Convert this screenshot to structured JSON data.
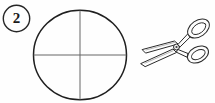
{
  "worksheet": {
    "background_color": "#fefefe",
    "ink_color": "#1a1a1a",
    "line_color": "#555555",
    "width": 215,
    "height": 103
  },
  "badge": {
    "number": "2",
    "shape": "circle-outline",
    "icon_name": "step-number-badge",
    "center_x": 16.5,
    "center_y": 18.5,
    "radius": 13.5
  },
  "figure": {
    "name": "circle-with-crosshair",
    "shape": "circle",
    "center_x": 80,
    "center_y": 55,
    "radius_x": 47,
    "radius_y": 45,
    "fold_lines": [
      {
        "name": "vertical-diameter",
        "x1": 80,
        "y1": 10,
        "x2": 80,
        "y2": 100
      },
      {
        "name": "horizontal-diameter",
        "x1": 33,
        "y1": 55,
        "x2": 127,
        "y2": 55
      }
    ]
  },
  "tool": {
    "name": "scissors",
    "icon_name": "scissors-icon",
    "orientation": "blades-point-lower-left",
    "bounds": {
      "x": 137,
      "y": 18,
      "width": 76,
      "height": 50
    }
  }
}
